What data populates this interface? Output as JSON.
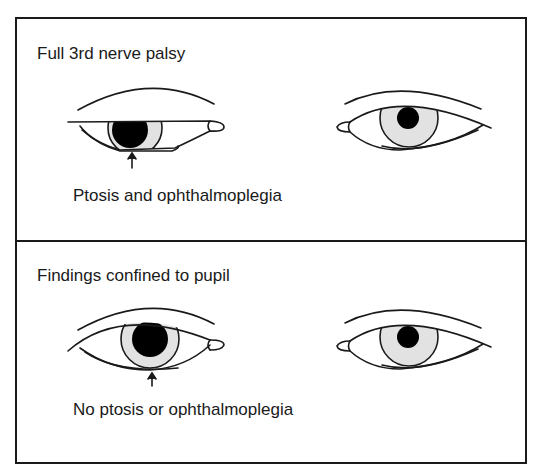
{
  "panels": [
    {
      "title": "Full 3rd nerve palsy",
      "caption": "Ptosis and ophthalmoplegia",
      "left_eye": "ptosis-dilated-pupil-deviated",
      "right_eye": "normal"
    },
    {
      "title": "Findings confined to pupil",
      "caption": "No ptosis or ophthalmoplegia",
      "left_eye": "dilated-pupil",
      "right_eye": "normal"
    }
  ],
  "colors": {
    "line": "#1a1a1a",
    "iris": "#e2e2e2",
    "pupil": "#000000",
    "background": "#ffffff"
  }
}
